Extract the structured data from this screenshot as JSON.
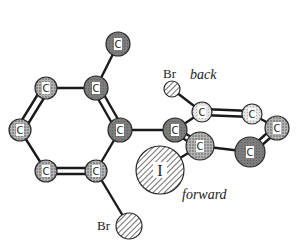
{
  "diagram": {
    "type": "molecular-structure",
    "labels": {
      "back": "back",
      "forward": "forward",
      "br_top": "Br",
      "br_bottom": "Br",
      "iodine": "I"
    },
    "atoms": [
      {
        "id": "c_methyl",
        "element": "C",
        "x": 118,
        "y": 44,
        "r": 12,
        "fill": "dark"
      },
      {
        "id": "c_ring1_a",
        "element": "C",
        "x": 46,
        "y": 88,
        "r": 11,
        "fill": "dotted"
      },
      {
        "id": "c_ring1_b",
        "element": "C",
        "x": 96,
        "y": 88,
        "r": 12,
        "fill": "dark"
      },
      {
        "id": "c_ring1_c",
        "element": "C",
        "x": 120,
        "y": 130,
        "r": 12,
        "fill": "dark"
      },
      {
        "id": "c_ring1_d",
        "element": "C",
        "x": 96,
        "y": 171,
        "r": 11,
        "fill": "dotted"
      },
      {
        "id": "c_ring1_e",
        "element": "C",
        "x": 46,
        "y": 171,
        "r": 11,
        "fill": "dotted"
      },
      {
        "id": "c_ring1_f",
        "element": "C",
        "x": 20,
        "y": 130,
        "r": 11,
        "fill": "dotted"
      },
      {
        "id": "c_ring2_a",
        "element": "C",
        "x": 175,
        "y": 130,
        "r": 12,
        "fill": "dark"
      },
      {
        "id": "c_ring2_b",
        "element": "C",
        "x": 202,
        "y": 112,
        "r": 10,
        "fill": "light"
      },
      {
        "id": "c_ring2_c",
        "element": "C",
        "x": 252,
        "y": 114,
        "r": 10,
        "fill": "light"
      },
      {
        "id": "c_ring2_d",
        "element": "C",
        "x": 277,
        "y": 128,
        "r": 12,
        "fill": "dotted"
      },
      {
        "id": "c_ring2_e",
        "element": "C",
        "x": 250,
        "y": 152,
        "r": 15,
        "fill": "dark"
      },
      {
        "id": "c_ring2_f",
        "element": "C",
        "x": 200,
        "y": 146,
        "r": 14,
        "fill": "dotted"
      },
      {
        "id": "br_top",
        "element": "Br",
        "x": 172,
        "y": 89,
        "r": 8,
        "fill": "hatched"
      },
      {
        "id": "br_bottom",
        "element": "Br",
        "x": 129,
        "y": 226,
        "r": 13,
        "fill": "hatched"
      },
      {
        "id": "iodine",
        "element": "I",
        "x": 160,
        "y": 170,
        "r": 24,
        "fill": "hatched"
      }
    ],
    "bonds": [
      {
        "from": "c_methyl",
        "to": "c_ring1_b",
        "order": 1
      },
      {
        "from": "c_ring1_a",
        "to": "c_ring1_b",
        "order": 1
      },
      {
        "from": "c_ring1_b",
        "to": "c_ring1_c",
        "order": 2
      },
      {
        "from": "c_ring1_c",
        "to": "c_ring1_d",
        "order": 1
      },
      {
        "from": "c_ring1_d",
        "to": "c_ring1_e",
        "order": 2
      },
      {
        "from": "c_ring1_e",
        "to": "c_ring1_f",
        "order": 1
      },
      {
        "from": "c_ring1_f",
        "to": "c_ring1_a",
        "order": 2
      },
      {
        "from": "c_ring1_c",
        "to": "c_ring2_a",
        "order": 1
      },
      {
        "from": "c_ring1_d",
        "to": "br_bottom",
        "order": 1
      },
      {
        "from": "c_ring2_a",
        "to": "c_ring2_b",
        "order": 1
      },
      {
        "from": "c_ring2_b",
        "to": "c_ring2_c",
        "order": 2
      },
      {
        "from": "c_ring2_c",
        "to": "c_ring2_d",
        "order": 1
      },
      {
        "from": "c_ring2_d",
        "to": "c_ring2_e",
        "order": 2
      },
      {
        "from": "c_ring2_e",
        "to": "c_ring2_f",
        "order": 1
      },
      {
        "from": "c_ring2_f",
        "to": "c_ring2_a",
        "order": 2
      },
      {
        "from": "c_ring2_b",
        "to": "br_top",
        "order": 1
      },
      {
        "from": "c_ring2_f",
        "to": "iodine",
        "order": 1
      }
    ],
    "colors": {
      "dark": "#7a7a7a",
      "dotted": "#9a9a9a",
      "light": "#d8d8d8",
      "bond": "#1a1a1a",
      "outline": "#2a2a2a"
    }
  }
}
